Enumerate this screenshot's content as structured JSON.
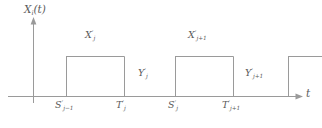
{
  "figure": {
    "background_color": "#ffffff",
    "line_color": "#8c8c8c",
    "text_color": "#5a5a5a",
    "width": 322,
    "height": 128
  },
  "axes": {
    "y_label": {
      "base": "X",
      "sub": "i",
      "suffix": "(t)"
    },
    "x_label": {
      "base": "t"
    },
    "origin": {
      "x": 33,
      "y": 96
    },
    "y_axis_top": 18,
    "y_axis_bottom": 103,
    "x_axis_right": 303
  },
  "pulses": [
    {
      "name": "pulse-j",
      "label": {
        "base": "X",
        "prime": "′",
        "sub": "j"
      },
      "start_label": {
        "base": "S",
        "prime": "′",
        "sub": "j−1"
      },
      "end_label": {
        "base": "T",
        "prime": "′",
        "sub": "j"
      },
      "x_start": 66,
      "x_end": 124,
      "top": 56
    },
    {
      "name": "pulse-j-plus-1",
      "label": {
        "base": "X",
        "prime": "′",
        "sub": "j+1"
      },
      "start_label": {
        "base": "S",
        "prime": "′",
        "sub": "j"
      },
      "end_label": {
        "base": "T",
        "prime": "′",
        "sub": "j+1"
      },
      "x_start": 175,
      "x_end": 233,
      "top": 56
    },
    {
      "name": "pulse-partial",
      "label": null,
      "x_start": 288,
      "x_end": 322,
      "top": 56
    }
  ],
  "gaps": [
    {
      "name": "gap-j",
      "label": {
        "base": "Y",
        "prime": "′",
        "sub": "j"
      }
    },
    {
      "name": "gap-j-plus-1",
      "label": {
        "base": "Y",
        "prime": "′",
        "sub": "j+1"
      }
    }
  ],
  "labels": {
    "y_axis": "X",
    "y_axis_sub": "i",
    "y_axis_suffix": "(t)",
    "x_axis": "t",
    "x_j_base": "X",
    "x_j_prime": "′",
    "x_j_sub": "j",
    "x_j1_base": "X",
    "x_j1_prime": "′",
    "x_j1_sub": "j+1",
    "y_j_base": "Y",
    "y_j_prime": "′",
    "y_j_sub": "j",
    "y_j1_base": "Y",
    "y_j1_prime": "′",
    "y_j1_sub": "j+1",
    "s_jm1_base": "S",
    "s_jm1_prime": "′",
    "s_jm1_sub": "j−1",
    "t_j_base": "T",
    "t_j_prime": "′",
    "t_j_sub": "j",
    "s_j_base": "S",
    "s_j_prime": "′",
    "s_j_sub": "j",
    "t_j1_base": "T",
    "t_j1_prime": "′",
    "t_j1_sub": "j+1"
  }
}
